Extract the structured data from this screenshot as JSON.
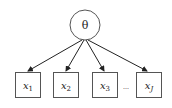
{
  "diagram": {
    "type": "latent-variable-model",
    "latent": {
      "label": "θ",
      "cx": 85,
      "cy": 25,
      "r": 15
    },
    "observed": [
      {
        "label": "x",
        "sub": "1",
        "x": 15,
        "y": 72,
        "w": 25,
        "h": 25
      },
      {
        "label": "x",
        "sub": "2",
        "x": 53,
        "y": 72,
        "w": 25,
        "h": 25
      },
      {
        "label": "x",
        "sub": "3",
        "x": 92,
        "y": 72,
        "w": 25,
        "h": 25
      },
      {
        "label": "x",
        "sub": "J",
        "x": 136,
        "y": 72,
        "w": 25,
        "h": 25
      }
    ],
    "ellipsis": "...",
    "edges": [
      {
        "from": "θ",
        "to": "x1"
      },
      {
        "from": "θ",
        "to": "x2"
      },
      {
        "from": "θ",
        "to": "x3"
      },
      {
        "from": "θ",
        "to": "xJ"
      }
    ],
    "colors": {
      "stroke": "#222222",
      "box_stroke": "#555555",
      "background": "#ffffff"
    }
  }
}
